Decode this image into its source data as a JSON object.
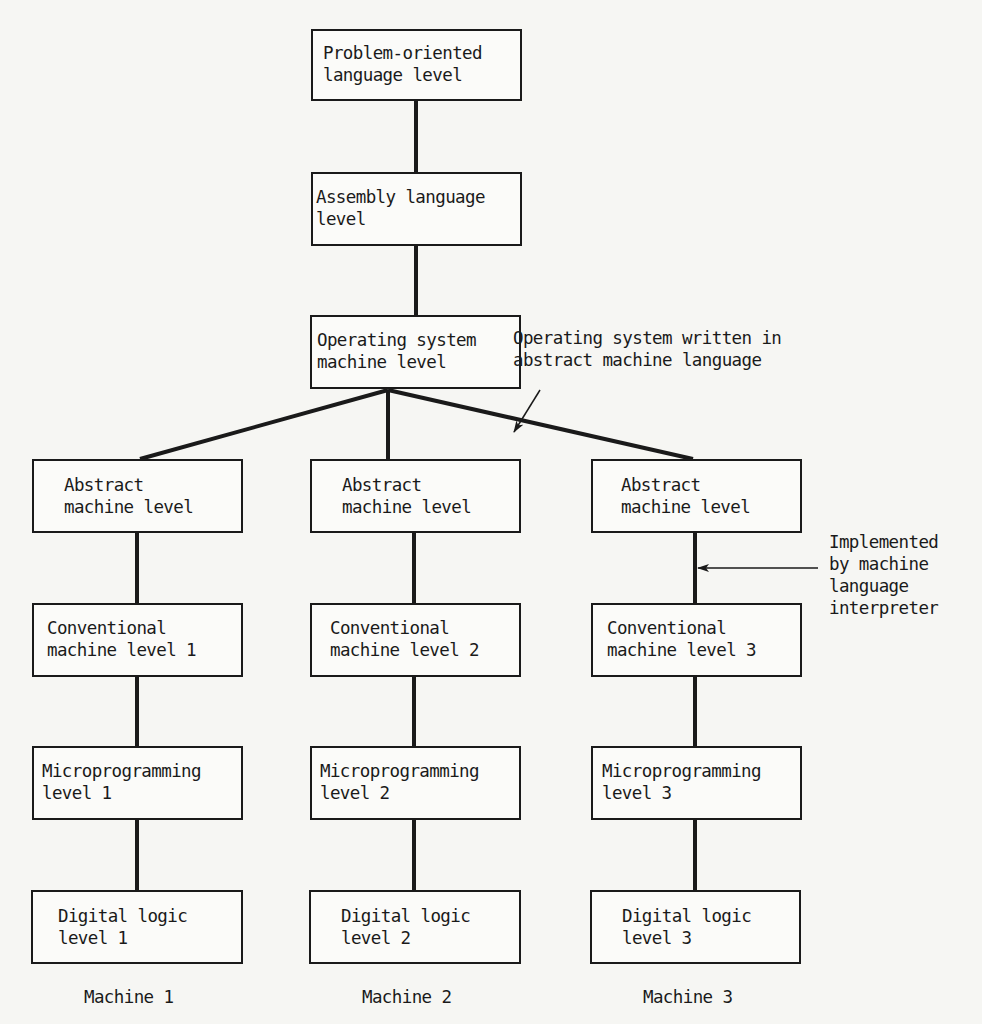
{
  "diagram": {
    "title_boxes": [
      {
        "id": "problem-oriented",
        "line1": "Problem-oriented",
        "line2": "language level"
      },
      {
        "id": "assembly",
        "line1": "Assembly language",
        "line2": "level"
      },
      {
        "id": "os",
        "line1": "Operating system",
        "line2": "machine level"
      }
    ],
    "machines": [
      {
        "label": "Machine 1",
        "levels": [
          {
            "line1": "Abstract",
            "line2": "machine level"
          },
          {
            "line1": "Conventional",
            "line2": "machine level 1"
          },
          {
            "line1": "Microprogramming",
            "line2": "level 1"
          },
          {
            "line1": "Digital logic",
            "line2": "level 1"
          }
        ]
      },
      {
        "label": "Machine 2",
        "levels": [
          {
            "line1": "Abstract",
            "line2": "machine level"
          },
          {
            "line1": "Conventional",
            "line2": "machine level 2"
          },
          {
            "line1": "Microprogramming",
            "line2": "level 2"
          },
          {
            "line1": "Digital logic",
            "line2": "level 2"
          }
        ]
      },
      {
        "label": "Machine 3",
        "levels": [
          {
            "line1": "Abstract",
            "line2": "machine level"
          },
          {
            "line1": "Conventional",
            "line2": "machine level 3"
          },
          {
            "line1": "Microprogramming",
            "line2": "level 3"
          },
          {
            "line1": "Digital logic",
            "line2": "level 3"
          }
        ]
      }
    ],
    "annotations": {
      "os_written": {
        "line1": "Operating system written in",
        "line2": "abstract machine language"
      },
      "implemented": {
        "line1": "Implemented",
        "line2": "by machine",
        "line3": "language",
        "line4": "interpreter"
      }
    },
    "colors": {
      "ink": "#1a1a1a",
      "paper": "#f6f6f3"
    }
  }
}
